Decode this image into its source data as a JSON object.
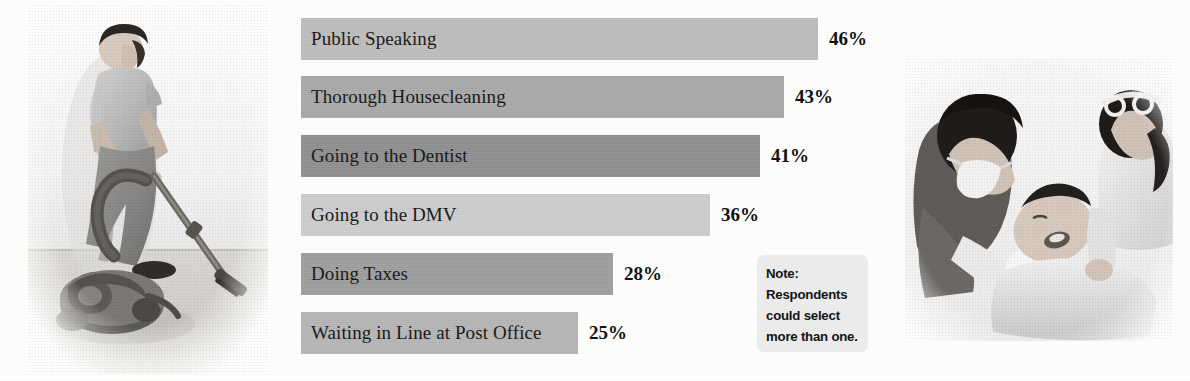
{
  "chart_data": {
    "type": "bar",
    "orientation": "horizontal",
    "title": "",
    "xlabel": "",
    "ylabel": "",
    "grid": false,
    "legend": false,
    "xlim": [
      0,
      50
    ],
    "categories": [
      "Public Speaking",
      "Thorough Housecleaning",
      "Going to the Dentist",
      "Going to the DMV",
      "Doing Taxes",
      "Waiting in Line at Post Office"
    ],
    "values": [
      46,
      43,
      41,
      36,
      28,
      25
    ],
    "value_labels": [
      "46%",
      "43%",
      "41%",
      "36%",
      "28%",
      "25%"
    ],
    "bar_colors": [
      "#bdbdbd",
      "#a9a9a9",
      "#8f8f8f",
      "#cccccc",
      "#9e9e9e",
      "#b5b5b5"
    ],
    "bar_pixel_widths": [
      517,
      483,
      459,
      409,
      312,
      277
    ],
    "annotations": [
      "Note: Respondents could select more than one."
    ]
  },
  "note": {
    "lines": [
      "Note:",
      "Respondents",
      "could select",
      "more than one."
    ]
  },
  "photos": {
    "left": {
      "alt": "man vacuuming a floor with a canister vacuum"
    },
    "right": {
      "alt": "dentist and assistant treating a patient in a dental chair"
    }
  },
  "colors": {
    "background": "#fdfdfc",
    "text": "#1a1a1a",
    "note_background": "#ebebeb"
  }
}
